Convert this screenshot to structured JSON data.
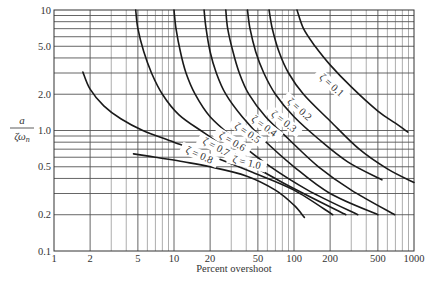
{
  "chart_data": {
    "type": "line",
    "title": "",
    "xlabel": "Percent overshoot",
    "ylabel": "a / ζω_n",
    "xscale": "log",
    "yscale": "log",
    "xlim": [
      1,
      1000
    ],
    "ylim": [
      0.1,
      10
    ],
    "grid": true,
    "legend": "none (curves labelled inline)",
    "x_ticks": [
      "1",
      "2",
      "5",
      "10",
      "20",
      "50",
      "100",
      "200",
      "500",
      "1000"
    ],
    "x_tick_values": [
      1,
      2,
      5,
      10,
      20,
      50,
      100,
      200,
      500,
      1000
    ],
    "y_ticks": [
      "0.1",
      "0.2",
      "0.5",
      "1.0",
      "2.0",
      "5.0",
      "10"
    ],
    "y_tick_values": [
      0.1,
      0.2,
      0.5,
      1.0,
      2.0,
      5.0,
      10
    ],
    "y_minor_gridlines": [
      0.3,
      0.4,
      0.6,
      0.7,
      0.8,
      0.9,
      3,
      4,
      6,
      7,
      8,
      9
    ],
    "series": [
      {
        "name": "ζ = 0.1",
        "label": "ζ = 0.1",
        "label_pos": [
          200,
          2.3
        ],
        "label_angle": 42,
        "points": [
          [
            106,
            10
          ],
          [
            120,
            7
          ],
          [
            150,
            5
          ],
          [
            200,
            3.5
          ],
          [
            300,
            2.3
          ],
          [
            500,
            1.45
          ],
          [
            700,
            1.15
          ],
          [
            890,
            0.97
          ]
        ]
      },
      {
        "name": "ζ = 0.2",
        "label": "ζ = 0.2",
        "label_pos": [
          108,
          1.45
        ],
        "label_angle": 42,
        "points": [
          [
            62,
            10
          ],
          [
            66,
            7
          ],
          [
            75,
            4.5
          ],
          [
            90,
            3
          ],
          [
            120,
            2
          ],
          [
            200,
            1.2
          ],
          [
            350,
            0.7
          ],
          [
            600,
            0.48
          ],
          [
            1000,
            0.37
          ]
        ]
      },
      {
        "name": "ζ = 0.3",
        "label": "ζ = 0.3",
        "label_pos": [
          80,
          1.15
        ],
        "label_angle": 38,
        "points": [
          [
            41,
            10
          ],
          [
            43,
            7
          ],
          [
            48,
            4.5
          ],
          [
            56,
            3
          ],
          [
            70,
            2
          ],
          [
            100,
            1.3
          ],
          [
            160,
            0.85
          ],
          [
            280,
            0.55
          ],
          [
            540,
            0.39
          ]
        ]
      },
      {
        "name": "ζ = 0.4",
        "label": "ζ = 0.4",
        "label_pos": [
          55,
          1.05
        ],
        "label_angle": 36,
        "points": [
          [
            27,
            10
          ],
          [
            28,
            7
          ],
          [
            31,
            4.5
          ],
          [
            35,
            3
          ],
          [
            42,
            2
          ],
          [
            58,
            1.3
          ],
          [
            90,
            0.85
          ],
          [
            160,
            0.5
          ],
          [
            300,
            0.32
          ],
          [
            690,
            0.2
          ]
        ]
      },
      {
        "name": "ζ = 0.5",
        "label": "ζ = 0.5",
        "label_pos": [
          40,
          0.92
        ],
        "label_angle": 34,
        "points": [
          [
            17.8,
            10
          ],
          [
            18.5,
            7
          ],
          [
            20,
            4.5
          ],
          [
            22.5,
            3
          ],
          [
            27,
            2
          ],
          [
            37,
            1.3
          ],
          [
            55,
            0.85
          ],
          [
            100,
            0.5
          ],
          [
            200,
            0.3
          ],
          [
            500,
            0.2
          ]
        ]
      },
      {
        "name": "ζ = 0.6",
        "label": "ζ = 0.6",
        "label_pos": [
          30,
          0.78
        ],
        "label_angle": 30,
        "points": [
          [
            10,
            10
          ],
          [
            10.4,
            7
          ],
          [
            11.3,
            4.5
          ],
          [
            12.6,
            3
          ],
          [
            15,
            2
          ],
          [
            20,
            1.3
          ],
          [
            32,
            0.85
          ],
          [
            60,
            0.52
          ],
          [
            130,
            0.32
          ],
          [
            340,
            0.2
          ]
        ]
      },
      {
        "name": "ζ = 0.7",
        "label": "ζ = 0.7",
        "label_pos": [
          22,
          0.7
        ],
        "label_angle": 28,
        "points": [
          [
            4.8,
            10
          ],
          [
            5.0,
            7
          ],
          [
            5.6,
            4.5
          ],
          [
            6.5,
            3
          ],
          [
            8,
            2
          ],
          [
            11,
            1.35
          ],
          [
            18,
            0.95
          ],
          [
            35,
            0.6
          ],
          [
            80,
            0.37
          ],
          [
            270,
            0.2
          ]
        ]
      },
      {
        "name": "ζ = 0.8",
        "label": "ζ = 0.8",
        "label_pos": [
          16,
          0.6
        ],
        "label_angle": 24,
        "points": [
          [
            1.74,
            3.05
          ],
          [
            2.0,
            2.2
          ],
          [
            2.6,
            1.6
          ],
          [
            3.6,
            1.25
          ],
          [
            5.5,
            1.0
          ],
          [
            10,
            0.8
          ],
          [
            20,
            0.62
          ],
          [
            45,
            0.45
          ],
          [
            100,
            0.32
          ],
          [
            210,
            0.2
          ]
        ]
      },
      {
        "name": "ζ = 1.0",
        "label": "ζ = 1.0",
        "label_pos": [
          40,
          0.52
        ],
        "label_angle": 14,
        "points": [
          [
            4.6,
            0.64
          ],
          [
            7,
            0.6
          ],
          [
            12,
            0.55
          ],
          [
            20,
            0.5
          ],
          [
            40,
            0.42
          ],
          [
            70,
            0.32
          ],
          [
            100,
            0.24
          ],
          [
            122,
            0.19
          ]
        ]
      }
    ]
  },
  "colors": {
    "background": "#ffffff",
    "curve": "#1a1a1a",
    "grid": "#555555",
    "text": "#333333"
  }
}
